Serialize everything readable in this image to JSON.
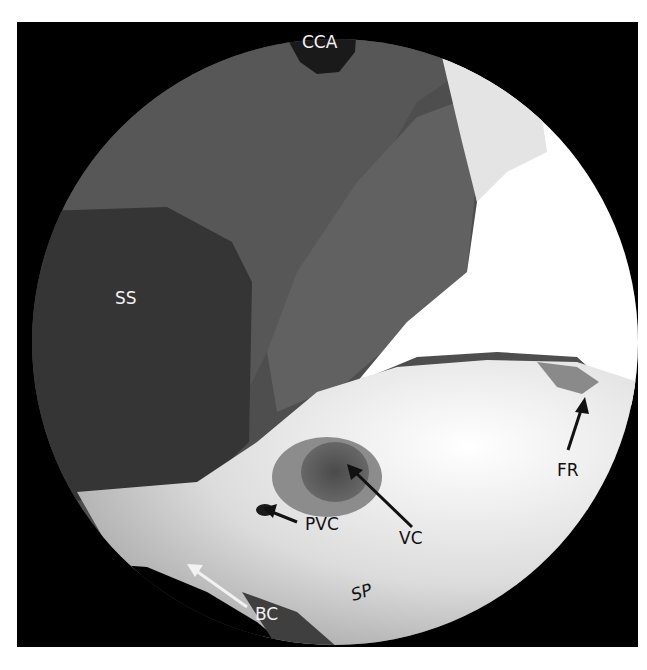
{
  "figure": {
    "colors": {
      "background": "#ffffff",
      "frame": "#000000",
      "dark_tissue": "#3a3a3a",
      "mid_tissue": "#555555",
      "bone_light": "#d6d6d6",
      "bright_region": "#ffffff"
    },
    "labels": [
      {
        "id": "cca",
        "text": "CCA",
        "arrow": "none",
        "text_color": "light"
      },
      {
        "id": "ss",
        "text": "SS",
        "arrow": "none",
        "text_color": "light"
      },
      {
        "id": "fr",
        "text": "FR",
        "arrow": "up",
        "text_color": "dark"
      },
      {
        "id": "vc",
        "text": "VC",
        "arrow": "up-left",
        "text_color": "dark"
      },
      {
        "id": "pvc",
        "text": "PVC",
        "arrow": "left",
        "text_color": "dark"
      },
      {
        "id": "sp",
        "text": "SP",
        "arrow": "none",
        "text_color": "dark"
      },
      {
        "id": "bc",
        "text": "BC",
        "arrow": "up-left",
        "text_color": "light"
      }
    ]
  }
}
